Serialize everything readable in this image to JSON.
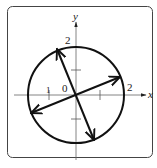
{
  "figure": {
    "axes": {
      "x_label": "x",
      "y_label": "y",
      "origin_label": "0",
      "x_ticks": [
        {
          "value": -1,
          "label": "1"
        },
        {
          "value": 1,
          "label": ""
        },
        {
          "value": 2,
          "label": "2"
        }
      ],
      "y_ticks": [
        {
          "value": 1,
          "label": ""
        },
        {
          "value": -1,
          "label": ""
        },
        {
          "value": 2,
          "label": "2"
        }
      ]
    },
    "circle": {
      "center": [
        0,
        0
      ],
      "radius": 2
    },
    "vectors": [
      {
        "name": "steep-diameter",
        "from": [
          -0.8,
          1.9
        ],
        "to": [
          0.8,
          -1.9
        ],
        "double_headed": true
      },
      {
        "name": "shallow-diameter",
        "from": [
          -1.8,
          -0.8
        ],
        "to": [
          1.8,
          0.8
        ],
        "double_headed": true
      }
    ],
    "labels": {
      "x_axis": "x",
      "y_axis": "y",
      "origin": "0",
      "tick_x_neg1": "1",
      "tick_x_2": "2",
      "tick_y_2": "2"
    },
    "colors": {
      "stroke": "#111111",
      "axis": "#555555",
      "frame": "#444444",
      "background": "#ffffff"
    }
  }
}
